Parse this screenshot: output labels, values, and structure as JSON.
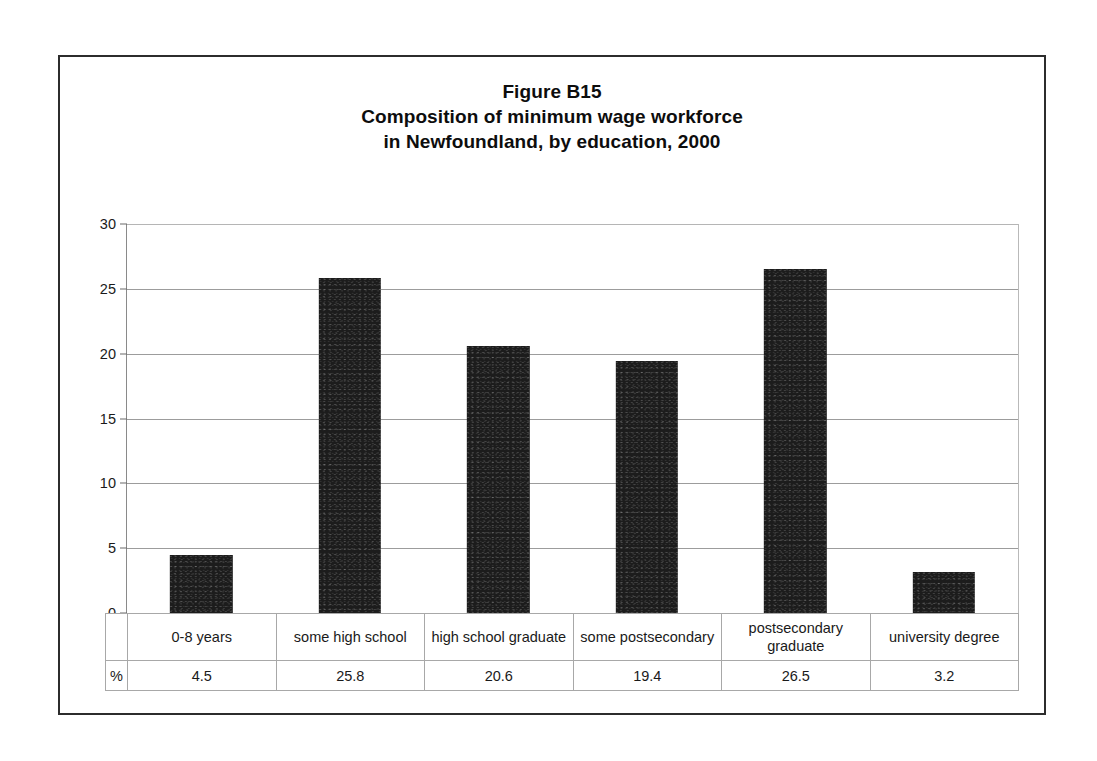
{
  "figure": {
    "title_lines": [
      "Figure B15",
      "Composition of minimum wage workforce",
      "in Newfoundland, by education, 2000"
    ]
  },
  "axis": {
    "unit_label": "%",
    "yticks": [
      "0",
      "5",
      "10",
      "15",
      "20",
      "25",
      "30"
    ]
  },
  "colors": {
    "bar": "#1c1c1c",
    "gridline": "#9c9c9c",
    "frame": "#2c2c2c",
    "table_border": "#a8a8a8",
    "text": "#1a1a1a"
  },
  "table": {
    "categories": [
      "0-8 years",
      "some high school",
      "high school graduate",
      "some postsecondary",
      "postsecondary graduate",
      "university degree"
    ],
    "values": [
      "4.5",
      "25.8",
      "20.6",
      "19.4",
      "26.5",
      "3.2"
    ]
  },
  "chart_data": {
    "type": "bar",
    "categories": [
      "0-8 years",
      "some high school",
      "high school graduate",
      "some postsecondary",
      "postsecondary graduate",
      "university degree"
    ],
    "values": [
      4.5,
      25.8,
      20.6,
      19.4,
      26.5,
      3.2
    ],
    "xlabel": "",
    "ylabel": "%",
    "ylim": [
      0,
      30
    ],
    "yticks": [
      0,
      5,
      10,
      15,
      20,
      25,
      30
    ],
    "grid": true,
    "legend": false
  }
}
